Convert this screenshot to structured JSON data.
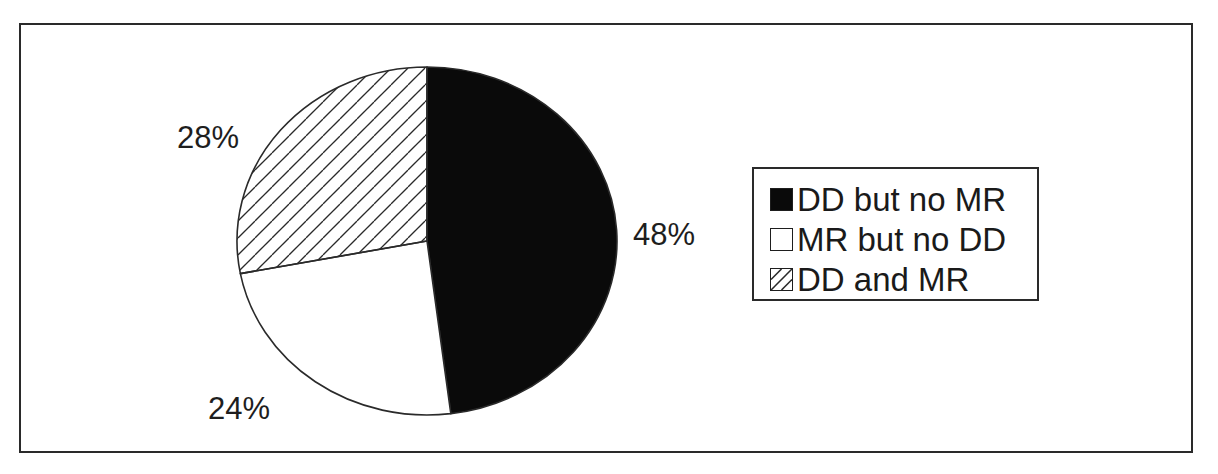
{
  "chart_data": {
    "type": "pie",
    "title": "",
    "categories": [
      "DD but no MR",
      "MR but no DD",
      "DD and MR"
    ],
    "values": [
      48,
      24,
      28
    ],
    "unit": "%",
    "labels": [
      "48%",
      "24%",
      "28%"
    ],
    "start_angle_deg": 0,
    "direction": "clockwise",
    "fills": [
      "solid-black",
      "white",
      "diagonal-hatch"
    ],
    "legend_position": "right",
    "grid": false
  },
  "colors": {
    "black_slice": "#0a0a0a",
    "white_slice": "#ffffff",
    "hatch_line": "#2a2a2a",
    "outline": "#2a2a2a",
    "text": "#1e1e1e"
  },
  "labels": {
    "slice_1": "48%",
    "slice_2": "24%",
    "slice_3": "28%"
  },
  "legend": {
    "items": [
      {
        "label": "DD but no MR",
        "swatch": "solid-black"
      },
      {
        "label": "MR but no DD",
        "swatch": "white"
      },
      {
        "label": "DD and MR",
        "swatch": "diagonal-hatch"
      }
    ]
  }
}
